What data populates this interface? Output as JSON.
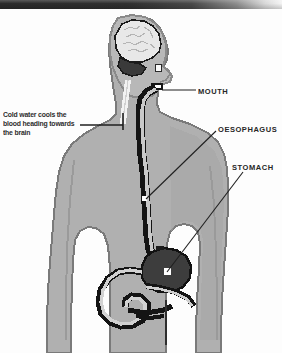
{
  "image": {
    "kind": "anatomical-diagram",
    "subject": "human-upper-body-digestive-tract",
    "width": 282,
    "height": 353
  },
  "header": {
    "bar_label": ""
  },
  "palette": {
    "background": "#fdfdfd",
    "body_fill": "#b0b0b0",
    "body_shade": "#9a9a9a",
    "body_light": "#c4c4c4",
    "outline": "#6f6f6f",
    "organ_outline": "#141414",
    "brain_fill": "#e8e8e8",
    "brain_detail": "#bcbcbc",
    "cerebellum": "#3a3a3a",
    "stomach_fill": "#3d3d3d",
    "highlight": "#ffffff",
    "text": "#2a2a2a",
    "leader_line": "#1f1f1f",
    "header_bar": "#2b2b2b"
  },
  "annotations": [
    {
      "id": "cold-water",
      "text": "Cold water cools the\nblood heading towards\nthe brain",
      "lines": [
        "Cold water cools the",
        "blood heading towards",
        "the brain"
      ],
      "side": "left",
      "leader": "horizontal-with-end-tick",
      "points_to": "neck-blood-vessel"
    },
    {
      "id": "mouth",
      "text": "MOUTH",
      "side": "right",
      "leader": "horizontal",
      "points_to": "mouth-opening"
    },
    {
      "id": "oesophagus",
      "text": "OESOPHAGUS",
      "side": "right",
      "leader": "diagonal",
      "points_to": "oesophagus-tube"
    },
    {
      "id": "stomach",
      "text": "STOMACH",
      "side": "right",
      "leader": "diagonal",
      "points_to": "stomach-organ"
    }
  ],
  "anatomy_parts": [
    {
      "id": "head",
      "label": "head-profile"
    },
    {
      "id": "brain",
      "label": "brain"
    },
    {
      "id": "cerebellum",
      "label": "cerebellum"
    },
    {
      "id": "eye",
      "label": "eye"
    },
    {
      "id": "mouth-opening",
      "label": "mouth-opening"
    },
    {
      "id": "neck-vessel",
      "label": "neck-blood-vessel"
    },
    {
      "id": "oesophagus",
      "label": "oesophagus-tube"
    },
    {
      "id": "stomach",
      "label": "stomach"
    },
    {
      "id": "intestines",
      "label": "intestines"
    },
    {
      "id": "torso",
      "label": "torso"
    },
    {
      "id": "arm-left",
      "label": "left-arm"
    },
    {
      "id": "arm-right",
      "label": "right-arm"
    }
  ]
}
